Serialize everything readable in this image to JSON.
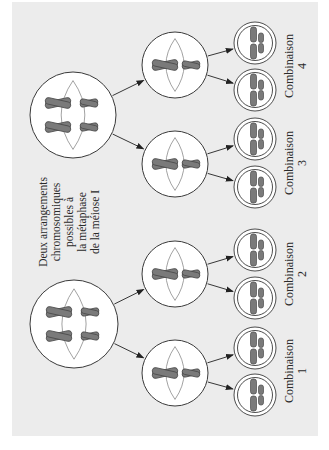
{
  "figure": {
    "orientation": "rotated-90-ccw",
    "colors": {
      "panel": "#ececec",
      "cell_fill": "#ffffff",
      "cell_stroke": "#3a3a3a",
      "spindle": "#8a8a8a",
      "chromosome_fill": "#7a7a7a",
      "chromosome_stroke": "#4a4a4a",
      "arrow": "#222222"
    },
    "caption_lines": [
      "Deux arrangements",
      "chromosomiques",
      "possibles à",
      "la métaphase",
      "de la méiose I"
    ],
    "arrangements": [
      {
        "name": "arrangement-a",
        "parent": {
          "cx": 73,
          "cy": 115,
          "r": 43
        },
        "daughters": [
          {
            "cell": {
              "cx": 175,
              "cy": 65,
              "r": 33
            },
            "gametes": [
              {
                "cx": 255,
                "cy": 43
              },
              {
                "cx": 255,
                "cy": 90
              }
            ],
            "label": {
              "word": "Combinaison",
              "number": "4",
              "x": 293,
              "y": 66
            }
          },
          {
            "cell": {
              "cx": 175,
              "cy": 164,
              "r": 33
            },
            "gametes": [
              {
                "cx": 255,
                "cy": 139
              },
              {
                "cx": 255,
                "cy": 187
              }
            ],
            "label": {
              "word": "Combinaison",
              "number": "3",
              "x": 293,
              "y": 163
            }
          }
        ]
      },
      {
        "name": "arrangement-b",
        "parent": {
          "cx": 74,
          "cy": 324,
          "r": 44
        },
        "daughters": [
          {
            "cell": {
              "cx": 175,
              "cy": 274,
              "r": 33
            },
            "gametes": [
              {
                "cx": 255,
                "cy": 250
              },
              {
                "cx": 255,
                "cy": 298
              }
            ],
            "label": {
              "word": "Combinaison",
              "number": "2",
              "x": 293,
              "y": 274
            }
          },
          {
            "cell": {
              "cx": 175,
              "cy": 373,
              "r": 33
            },
            "gametes": [
              {
                "cx": 255,
                "cy": 348
              },
              {
                "cx": 255,
                "cy": 395
              }
            ],
            "label": {
              "word": "Combinaison",
              "number": "1",
              "x": 293,
              "y": 371
            }
          }
        ]
      }
    ]
  }
}
